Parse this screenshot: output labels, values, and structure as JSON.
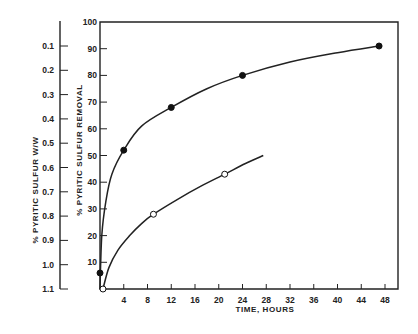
{
  "chart_data": {
    "type": "line",
    "title": "",
    "xlabel": "TIME, HOURS",
    "ylabel": "% PYRITIC SULFUR REMOVAL",
    "ylabel_secondary": "% PYRITIC SULFUR W/W",
    "xlim": [
      0,
      50
    ],
    "ylim": [
      0,
      100
    ],
    "x_ticks": [
      4,
      8,
      12,
      16,
      20,
      24,
      28,
      32,
      36,
      40,
      44,
      48
    ],
    "y_ticks": [
      10,
      20,
      30,
      40,
      50,
      60,
      70,
      80,
      90,
      100
    ],
    "y_secondary_ticks": [
      "0.1",
      "0.2",
      "0.3",
      "0.4",
      "0.5",
      "0.6",
      "0.7",
      "0.8",
      "0.9",
      "1.0",
      "1.1"
    ],
    "grid": false,
    "legend": null,
    "series": [
      {
        "name": "filled circles",
        "marker": "filled-circle",
        "points": [
          {
            "x": 0,
            "y": 6
          },
          {
            "x": 4,
            "y": 52
          },
          {
            "x": 12,
            "y": 68
          },
          {
            "x": 24,
            "y": 80
          },
          {
            "x": 47,
            "y": 91
          }
        ],
        "curve": [
          [
            0,
            0
          ],
          [
            0.3,
            20
          ],
          [
            1,
            33
          ],
          [
            2,
            43
          ],
          [
            4,
            52
          ],
          [
            7,
            61
          ],
          [
            12,
            68
          ],
          [
            18,
            75
          ],
          [
            24,
            80
          ],
          [
            32,
            85
          ],
          [
            40,
            88.5
          ],
          [
            47,
            91
          ]
        ]
      },
      {
        "name": "open circles",
        "marker": "open-circle",
        "points": [
          {
            "x": 0.5,
            "y": 0
          },
          {
            "x": 9,
            "y": 28
          },
          {
            "x": 21,
            "y": 43
          }
        ],
        "curve": [
          [
            0.5,
            0
          ],
          [
            1.5,
            8
          ],
          [
            3,
            14.5
          ],
          [
            5,
            20
          ],
          [
            7,
            24.5
          ],
          [
            9,
            28
          ],
          [
            13,
            33.5
          ],
          [
            17,
            38.5
          ],
          [
            21,
            43
          ],
          [
            24.5,
            47
          ],
          [
            27.5,
            50
          ]
        ]
      }
    ]
  },
  "axes": {
    "x_title": "TIME, HOURS",
    "y_title": "% PYRITIC SULFUR REMOVAL",
    "y2_title": "% PYRITIC SULFUR W/W",
    "x_tick_labels": [
      "4",
      "8",
      "12",
      "16",
      "20",
      "24",
      "28",
      "32",
      "36",
      "40",
      "44",
      "48"
    ],
    "y_tick_labels": [
      "10",
      "20",
      "30",
      "40",
      "50",
      "60",
      "70",
      "80",
      "90",
      "100"
    ],
    "y2_tick_labels": [
      "0.1",
      "0.2",
      "0.3",
      "0.4",
      "0.5",
      "0.6",
      "0.7",
      "0.8",
      "0.9",
      "1.0",
      "1.1"
    ]
  }
}
